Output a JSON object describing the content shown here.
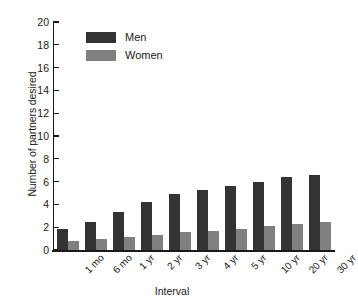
{
  "chart_data": {
    "type": "bar",
    "title": "",
    "xlabel": "Interval",
    "ylabel": "Number of partners desired",
    "categories": [
      "1 mo",
      "6 mo",
      "1 yr",
      "2 yr",
      "3 yr",
      "4 yr",
      "5 yr",
      "10 yr",
      "20 yr",
      "30 yr"
    ],
    "series": [
      {
        "name": "Men",
        "color": "#333333",
        "values": [
          1.85,
          2.5,
          3.3,
          4.2,
          4.95,
          5.3,
          5.65,
          5.95,
          6.4,
          6.6
        ]
      },
      {
        "name": "Women",
        "color": "#808080",
        "values": [
          0.8,
          1.0,
          1.15,
          1.35,
          1.55,
          1.7,
          1.85,
          2.1,
          2.25,
          2.45
        ]
      }
    ],
    "ylim": [
      0,
      20
    ],
    "yticks": [
      0,
      2,
      4,
      6,
      8,
      10,
      12,
      14,
      16,
      18,
      20
    ],
    "grid": false,
    "legend_position": "top-left"
  },
  "legend": {
    "items": [
      {
        "label": "Men"
      },
      {
        "label": "Women"
      }
    ]
  },
  "axes": {
    "x_title": "Interval",
    "y_title": "Number of partners desired"
  }
}
